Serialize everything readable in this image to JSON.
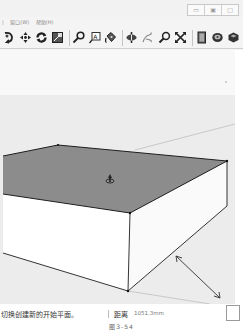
{
  "window": {
    "buttons": [
      {
        "name": "minimize",
        "glyph": "▭"
      },
      {
        "name": "restore",
        "glyph": "▣"
      },
      {
        "name": "close",
        "glyph": "□"
      }
    ]
  },
  "menubar": {
    "items": [
      {
        "label": "|"
      },
      {
        "label": "窗口(W)"
      },
      {
        "label": "帮助(H)"
      }
    ]
  },
  "toolbar": {
    "groups": [
      [
        "orbit-icon",
        "pan-icon",
        "rotate-icon",
        "scale-icon"
      ],
      [
        "tape-measure-icon",
        "text-icon",
        "paint-bucket-icon"
      ],
      [
        "axes-icon",
        "walk-icon",
        "zoom-icon",
        "zoom-extents-icon"
      ],
      [
        "components-icon",
        "materials-icon",
        "styles-icon"
      ]
    ]
  },
  "viewport": {
    "sky_color": "#f7f7f7",
    "ground_color": "#ececec",
    "top_face_color": "#8c8c8c",
    "side_face_color": "#ffffff",
    "edge_color": "#1e1e1e",
    "cursor": "move-cursor-icon"
  },
  "statusbar": {
    "message": "切换创建新的开始平面。",
    "vcb_label": "距离",
    "vcb_value": "1051.3mm"
  },
  "caption": "图3-54"
}
